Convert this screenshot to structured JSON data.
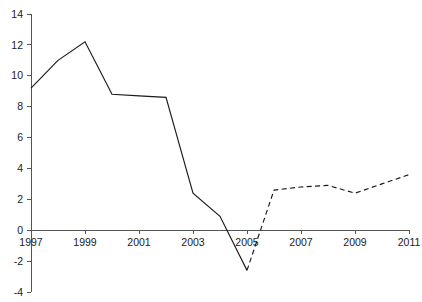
{
  "chart_data": {
    "type": "line",
    "title": "",
    "subtitle": "",
    "xlabel": "",
    "ylabel": "",
    "xlim": [
      1997,
      2011
    ],
    "ylim": [
      -4,
      14
    ],
    "grid": false,
    "legend": "none",
    "x": [
      1997,
      1998,
      1999,
      2000,
      2001,
      2002,
      2003,
      2004,
      2005,
      2006,
      2007,
      2008,
      2009,
      2010,
      2011
    ],
    "xticks": [
      "1997",
      "1999",
      "2001",
      "2003",
      "2005",
      "2007",
      "2009",
      "2011"
    ],
    "xtick_values": [
      1997,
      1999,
      2001,
      2003,
      2005,
      2007,
      2009,
      2011
    ],
    "yticks": [
      "14",
      "12",
      "10",
      "8",
      "6",
      "4",
      "2",
      "0",
      "-2",
      "-4"
    ],
    "ytick_values": [
      14,
      12,
      10,
      8,
      6,
      4,
      2,
      0,
      -2,
      -4
    ],
    "series": [
      {
        "name": "actual",
        "style": "solid",
        "color": "#1a1a1a",
        "x": [
          1997,
          1998,
          1999,
          2000,
          2001,
          2002,
          2003,
          2004,
          2005
        ],
        "values": [
          9.2,
          11.0,
          12.2,
          8.8,
          8.7,
          8.6,
          2.4,
          0.9,
          -2.6
        ]
      },
      {
        "name": "forecast",
        "style": "dashed",
        "color": "#1a1a1a",
        "x": [
          2005,
          2006,
          2007,
          2008,
          2009,
          2010,
          2011
        ],
        "values": [
          -2.6,
          2.6,
          2.8,
          2.9,
          2.4,
          3.0,
          3.6
        ]
      }
    ]
  },
  "colors": {
    "axis": "#555555",
    "line": "#1a1a1a",
    "background": "#ffffff"
  }
}
